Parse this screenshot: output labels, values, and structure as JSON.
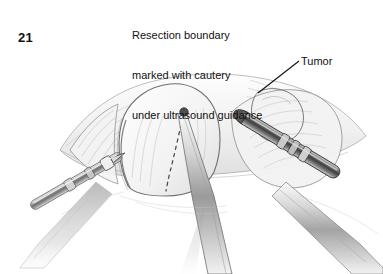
{
  "figure": {
    "number": "21",
    "caption_lines": [
      "Resection boundary",
      "marked with cautery",
      "under ultrasound guidance"
    ],
    "caption_full": "Resection boundary marked with cautery under ultrasound guidance"
  },
  "annotations": {
    "tumor_label": "Tumor"
  },
  "illustration": {
    "subject": "laparoscopic liver resection",
    "style": "graphite pencil medical illustration",
    "background_color": "#ffffff",
    "ink_color": "#3a3a3a",
    "tissue_shade": "#e9e9e9",
    "instrument_shade": "#8e8e8e",
    "elements": [
      "liver-lobe",
      "dashed-resection-boundary",
      "cautery-probe",
      "ultrasound-probe",
      "tumor-outline",
      "retractor-shaft",
      "grasper-shaft"
    ]
  }
}
